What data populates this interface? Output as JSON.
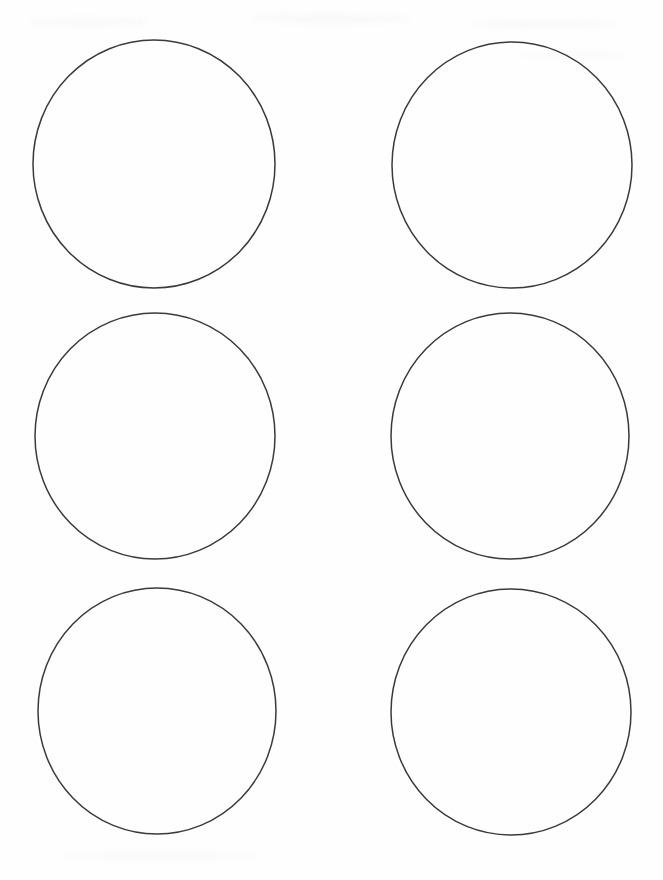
{
  "sheet": {
    "kind": "blank-circle-template-page",
    "rows": 3,
    "columns": 2,
    "circle_count": 6
  },
  "colors": {
    "background": "#fefefe",
    "circle_stroke": "#3a3a3a"
  },
  "stroke_width": 1.5,
  "circles": [
    {
      "cx": 154,
      "cy": 164,
      "rx": 121,
      "ry": 124
    },
    {
      "cx": 512,
      "cy": 165,
      "rx": 120,
      "ry": 123
    },
    {
      "cx": 155,
      "cy": 436,
      "rx": 120,
      "ry": 123
    },
    {
      "cx": 510,
      "cy": 436,
      "rx": 119,
      "ry": 123
    },
    {
      "cx": 157,
      "cy": 711,
      "rx": 119,
      "ry": 123
    },
    {
      "cx": 511,
      "cy": 712,
      "rx": 120,
      "ry": 123
    }
  ],
  "scan_artifacts": [
    {
      "x": 30,
      "y": 18,
      "w": 120,
      "h": 8,
      "opacity": 0.05
    },
    {
      "x": 250,
      "y": 14,
      "w": 160,
      "h": 9,
      "opacity": 0.05
    },
    {
      "x": 470,
      "y": 20,
      "w": 150,
      "h": 8,
      "opacity": 0.05
    },
    {
      "x": 520,
      "y": 52,
      "w": 110,
      "h": 7,
      "opacity": 0.04
    },
    {
      "x": 60,
      "y": 852,
      "w": 200,
      "h": 8,
      "opacity": 0.04
    }
  ]
}
